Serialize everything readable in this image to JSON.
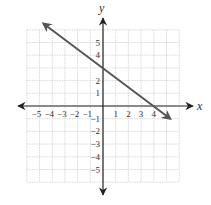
{
  "chart_data": {
    "type": "line",
    "title": "",
    "xlabel": "x",
    "ylabel": "y",
    "xlim": [
      -6,
      6
    ],
    "ylim": [
      -6,
      6
    ],
    "grid": true,
    "x_ticks": [
      "-5",
      "-4",
      "-3",
      "-2",
      "-1",
      "1",
      "2",
      "3",
      "4"
    ],
    "y_ticks": [
      "5",
      "4",
      "2",
      "1",
      "-1",
      "-2",
      "-3",
      "-4",
      "-5"
    ],
    "series": [
      {
        "name": "line",
        "equation": "y = -3/4 x + 3",
        "x": [
          -4.7,
          5.3
        ],
        "y": [
          6.5,
          -1.0
        ],
        "intercepts": {
          "x": 4,
          "y": 3
        },
        "arrows": "both",
        "color": "#555555"
      }
    ]
  },
  "colors": {
    "axis": "#222222",
    "grid": "#c8c8c8",
    "line": "#555555",
    "text": "#333333"
  }
}
